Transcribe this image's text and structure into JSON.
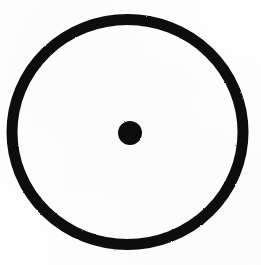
{
  "image": {
    "title": "Circled dot symbol",
    "description": "A thick black circular ring with a small solid black dot at its center on a plain white background",
    "symbol_name": "circled-dot",
    "unicode_glyph": "⊙",
    "background_color": "#fefefe",
    "ink_color": "#111111",
    "canvas": {
      "width": 261,
      "height": 265
    }
  },
  "shapes": {
    "outer_ring": {
      "name": "outer-ring",
      "shape": "annulus",
      "center_x": 127.5,
      "center_y": 132,
      "radius_x": 115.5,
      "radius_y": 112.5,
      "stroke_width": 11,
      "stroke_color": "#111111",
      "fill": "none"
    },
    "center_dot": {
      "name": "center-dot",
      "shape": "filled-circle",
      "center_x": 130,
      "center_y": 133,
      "radius": 12,
      "fill_color": "#111111",
      "stroke": "none"
    }
  }
}
